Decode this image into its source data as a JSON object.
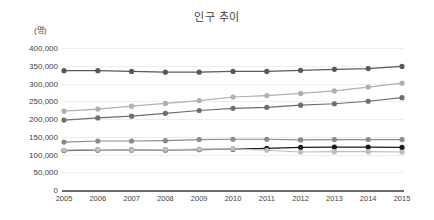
{
  "chart_data": {
    "type": "line",
    "title": "인구 추이",
    "xlabel": "",
    "ylabel": "(명)",
    "ylim": [
      0,
      400000
    ],
    "ytick_labels": [
      "400,000",
      "350,000",
      "300,000",
      "250,000",
      "200,000",
      "150,000",
      "100,000",
      "50,000",
      "0"
    ],
    "ytick_values": [
      400000,
      350000,
      300000,
      250000,
      200000,
      150000,
      100000,
      50000,
      0
    ],
    "grid": true,
    "legend": "none",
    "categories": [
      "2005",
      "2006",
      "2007",
      "2008",
      "2009",
      "2010",
      "2011",
      "2012",
      "2013",
      "2014",
      "2015"
    ],
    "x": [
      2005,
      2006,
      2007,
      2008,
      2009,
      2010,
      2011,
      2012,
      2013,
      2014,
      2015
    ],
    "series": [
      {
        "name": "series-1",
        "color": "#595959",
        "values": [
          336000,
          336000,
          334000,
          332000,
          332000,
          334000,
          334000,
          337000,
          340000,
          342000,
          348000
        ]
      },
      {
        "name": "series-2",
        "color": "#b0b0b0",
        "values": [
          222000,
          228000,
          236000,
          244000,
          252000,
          262000,
          266000,
          272000,
          279000,
          290000,
          301000
        ]
      },
      {
        "name": "series-3",
        "color": "#6e6e6e",
        "values": [
          197000,
          203000,
          208000,
          216000,
          224000,
          230000,
          233000,
          239000,
          243000,
          250000,
          260000
        ]
      },
      {
        "name": "series-4",
        "color": "#8a8a8a",
        "values": [
          135000,
          138000,
          138000,
          139000,
          142000,
          143000,
          143000,
          141000,
          142000,
          142000,
          142000
        ]
      },
      {
        "name": "series-5",
        "color": "#1a1a1a",
        "values": [
          111000,
          113000,
          113000,
          113000,
          114000,
          115000,
          117000,
          120000,
          121000,
          121000,
          120000
        ]
      },
      {
        "name": "series-6",
        "color": "#bdbdbd",
        "values": [
          112000,
          114000,
          113000,
          114000,
          115000,
          116000,
          112000,
          107000,
          108000,
          108000,
          107000
        ]
      }
    ]
  }
}
